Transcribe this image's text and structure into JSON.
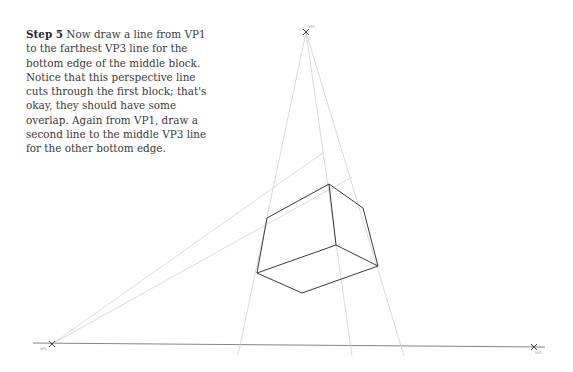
{
  "instruction": {
    "step_label": "Step 5",
    "body": " Now draw a line from VP1 to the farthest VP3 line for the bottom edge of the middle block. Notice that this perspective line cuts through the first block; that's okay, they should have some overlap. Again from VP1, draw a second line to the middle VP3 line for the other bottom edge."
  },
  "vanishing_points": {
    "vp1": {
      "label": "VP1",
      "x": 52,
      "y": 344
    },
    "vp2": {
      "label": "VP2",
      "x": 534,
      "y": 347
    },
    "vp3": {
      "label": "VP3",
      "x": 306,
      "y": 32
    }
  },
  "colors": {
    "horizon": "#555555",
    "guide": "#cccccc",
    "box": "#333333"
  }
}
